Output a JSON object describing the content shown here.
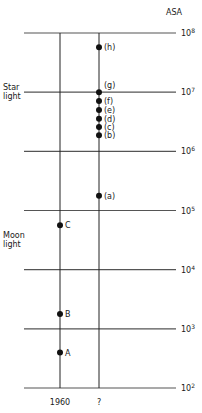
{
  "diagram": {
    "axis_title": "ASA",
    "scale_type": "log10",
    "levels": [
      {
        "exp": 8,
        "base": "10",
        "sup": "8"
      },
      {
        "exp": 7,
        "base": "10",
        "sup": "7"
      },
      {
        "exp": 6,
        "base": "10",
        "sup": "6"
      },
      {
        "exp": 5,
        "base": "10",
        "sup": "5"
      },
      {
        "exp": 4,
        "base": "10",
        "sup": "4"
      },
      {
        "exp": 3,
        "base": "10",
        "sup": "3"
      },
      {
        "exp": 2,
        "base": "10",
        "sup": "2"
      }
    ],
    "columns": [
      {
        "id": "c1960",
        "label": "1960"
      },
      {
        "id": "cfuture",
        "label": "?"
      }
    ],
    "side_labels": [
      {
        "id": "starlight",
        "lines": [
          "Star",
          "light"
        ],
        "at_exp": 7
      },
      {
        "id": "moonlight",
        "lines": [
          "Moon",
          "light"
        ],
        "at_exp": 4.5
      }
    ],
    "points": [
      {
        "label": "A",
        "column": "c1960",
        "log_asa": 2.6
      },
      {
        "label": "B",
        "column": "c1960",
        "log_asa": 3.25
      },
      {
        "label": "C",
        "column": "c1960",
        "log_asa": 4.75
      },
      {
        "label": "(a)",
        "column": "cfuture",
        "log_asa": 5.25
      },
      {
        "label": "(b)",
        "column": "cfuture",
        "log_asa": 6.27
      },
      {
        "label": "(c)",
        "column": "cfuture",
        "log_asa": 6.41
      },
      {
        "label": "(d)",
        "column": "cfuture",
        "log_asa": 6.55
      },
      {
        "label": "(e)",
        "column": "cfuture",
        "log_asa": 6.7
      },
      {
        "label": "(f)",
        "column": "cfuture",
        "log_asa": 6.85
      },
      {
        "label": "(g)",
        "column": "cfuture",
        "log_asa": 7.0
      },
      {
        "label": "(h)",
        "column": "cfuture",
        "log_asa": 7.76
      }
    ]
  }
}
